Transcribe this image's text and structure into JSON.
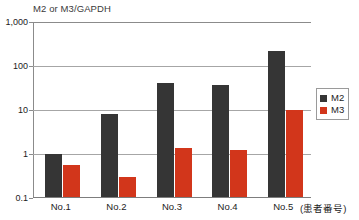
{
  "chart_data": {
    "type": "bar",
    "title": "M2 or M3/GAPDH",
    "xlabel": "(患者番号)",
    "ylabel": "M2 or M3/GAPDH",
    "yscale": "log",
    "ylim": [
      0.1,
      1000
    ],
    "ytick_labels": [
      "1,000",
      "100",
      "10",
      "1",
      "0.1"
    ],
    "ytick_values": [
      1000,
      100,
      10,
      1,
      0.1
    ],
    "grid": true,
    "legend_position": "right",
    "categories": [
      "No.1",
      "No.2",
      "No.3",
      "No.4",
      "No.5"
    ],
    "series": [
      {
        "name": "M2",
        "color": "#353535",
        "values": [
          1.0,
          8.0,
          41,
          38,
          220
        ]
      },
      {
        "name": "M3",
        "color": "#d2361b",
        "values": [
          0.55,
          0.3,
          1.35,
          1.25,
          10
        ]
      }
    ]
  },
  "axis": {
    "title": "M2 or M3/GAPDH",
    "unit_note": "(患者番号)",
    "yticks": [
      {
        "label": "1,000"
      },
      {
        "label": "100"
      },
      {
        "label": "10"
      },
      {
        "label": "1"
      },
      {
        "label": "0.1"
      }
    ],
    "xticks": [
      {
        "label": "No.1"
      },
      {
        "label": "No.2"
      },
      {
        "label": "No.3"
      },
      {
        "label": "No.4"
      },
      {
        "label": "No.5"
      }
    ]
  },
  "legend": {
    "items": [
      {
        "label": "M2",
        "color": "#353535"
      },
      {
        "label": "M3",
        "color": "#d2361b"
      }
    ]
  }
}
